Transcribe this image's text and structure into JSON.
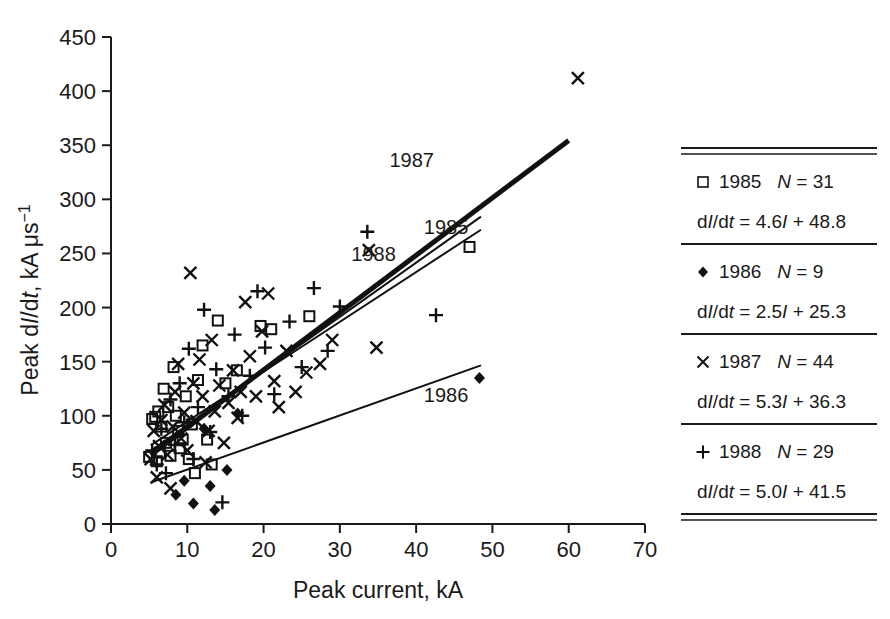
{
  "chart_data": {
    "type": "scatter",
    "title": "",
    "xlabel": "Peak current, kA",
    "ylabel_parts": {
      "pre": "Peak d",
      "i1": "I",
      "mid": "/d",
      "i2": "t",
      "post": ", kA μs",
      "sup": "−1"
    },
    "ylabel": "Peak dI/dt, kA μs−1",
    "xlim": [
      0,
      70
    ],
    "ylim": [
      0,
      450
    ],
    "xticks": [
      "0",
      "10",
      "20",
      "30",
      "40",
      "50",
      "60",
      "70"
    ],
    "yticks": [
      "0",
      "50",
      "100",
      "150",
      "200",
      "250",
      "300",
      "350",
      "400",
      "450"
    ],
    "xtick_values": [
      0,
      10,
      20,
      30,
      40,
      50,
      60,
      70
    ],
    "ytick_values": [
      0,
      50,
      100,
      150,
      200,
      250,
      300,
      350,
      400,
      450
    ],
    "grid": false,
    "legend_position": "right-table",
    "inline_labels": [
      {
        "text": "1987",
        "x": 36.5,
        "y": 330
      },
      {
        "text": "1985",
        "x": 41.0,
        "y": 268
      },
      {
        "text": "1988",
        "x": 31.5,
        "y": 243
      },
      {
        "text": "1986",
        "x": 41.0,
        "y": 113
      }
    ],
    "series": [
      {
        "name": "1985",
        "marker": "open-square",
        "n": 31,
        "fit": {
          "slope": 4.6,
          "intercept": 48.8,
          "x_start": 5.2,
          "x_end": 48.5,
          "label": "1985",
          "weight": "normal"
        },
        "points": [
          [
            5.0,
            62
          ],
          [
            5.4,
            97
          ],
          [
            5.8,
            99
          ],
          [
            6.0,
            58
          ],
          [
            6.2,
            104
          ],
          [
            6.4,
            66
          ],
          [
            6.6,
            90
          ],
          [
            6.9,
            125
          ],
          [
            7.2,
            75
          ],
          [
            7.5,
            108
          ],
          [
            7.8,
            63
          ],
          [
            8.2,
            145
          ],
          [
            8.5,
            100
          ],
          [
            8.8,
            86
          ],
          [
            9.0,
            70
          ],
          [
            9.4,
            78
          ],
          [
            9.8,
            118
          ],
          [
            10.2,
            60
          ],
          [
            10.6,
            92
          ],
          [
            11.0,
            47
          ],
          [
            11.4,
            133
          ],
          [
            12.0,
            165
          ],
          [
            12.6,
            78
          ],
          [
            13.2,
            55
          ],
          [
            14.0,
            188
          ],
          [
            15.0,
            130
          ],
          [
            16.5,
            142
          ],
          [
            19.6,
            183
          ],
          [
            21.0,
            180
          ],
          [
            26.0,
            192
          ],
          [
            47.0,
            256
          ]
        ]
      },
      {
        "name": "1986",
        "marker": "filled-diamond",
        "n": 9,
        "fit": {
          "slope": 2.5,
          "intercept": 25.3,
          "x_start": 5.2,
          "x_end": 48.5,
          "label": "1986",
          "weight": "normal"
        },
        "points": [
          [
            8.5,
            27
          ],
          [
            9.6,
            40
          ],
          [
            10.8,
            19
          ],
          [
            12.2,
            88
          ],
          [
            13.0,
            35
          ],
          [
            13.6,
            13
          ],
          [
            15.2,
            50
          ],
          [
            16.6,
            102
          ],
          [
            48.3,
            135
          ]
        ]
      },
      {
        "name": "1987",
        "marker": "cross",
        "n": 44,
        "fit": {
          "slope": 5.3,
          "intercept": 36.3,
          "x_start": 5.2,
          "x_end": 60.0,
          "label": "1987",
          "weight": "thick"
        },
        "points": [
          [
            5.2,
            60
          ],
          [
            5.6,
            86
          ],
          [
            6.0,
            43
          ],
          [
            6.3,
            72
          ],
          [
            6.6,
            96
          ],
          [
            7.0,
            110
          ],
          [
            7.4,
            64
          ],
          [
            7.8,
            33
          ],
          [
            8.1,
            90
          ],
          [
            8.4,
            122
          ],
          [
            8.8,
            148
          ],
          [
            9.2,
            79
          ],
          [
            9.6,
            103
          ],
          [
            10.0,
            68
          ],
          [
            10.4,
            232
          ],
          [
            10.8,
            130
          ],
          [
            11.2,
            95
          ],
          [
            11.6,
            152
          ],
          [
            12.0,
            118
          ],
          [
            12.4,
            57
          ],
          [
            12.8,
            86
          ],
          [
            13.2,
            170
          ],
          [
            13.6,
            104
          ],
          [
            14.2,
            128
          ],
          [
            14.8,
            75
          ],
          [
            15.4,
            112
          ],
          [
            16.0,
            142
          ],
          [
            16.6,
            98
          ],
          [
            17.0,
            122
          ],
          [
            17.6,
            205
          ],
          [
            18.2,
            155
          ],
          [
            19.0,
            118
          ],
          [
            19.8,
            178
          ],
          [
            20.6,
            213
          ],
          [
            21.4,
            132
          ],
          [
            22.0,
            108
          ],
          [
            23.0,
            160
          ],
          [
            24.2,
            122
          ],
          [
            25.6,
            140
          ],
          [
            27.4,
            148
          ],
          [
            29.0,
            170
          ],
          [
            33.8,
            253
          ],
          [
            34.8,
            163
          ],
          [
            61.2,
            412
          ]
        ]
      },
      {
        "name": "1988",
        "marker": "plus",
        "n": 29,
        "fit": {
          "slope": 5.0,
          "intercept": 41.5,
          "x_start": 5.2,
          "x_end": 48.5,
          "label": "1988",
          "weight": "normal"
        },
        "points": [
          [
            5.4,
            68
          ],
          [
            6.0,
            55
          ],
          [
            6.6,
            88
          ],
          [
            7.2,
            47
          ],
          [
            7.8,
            115
          ],
          [
            8.4,
            73
          ],
          [
            9.0,
            130
          ],
          [
            9.6,
            94
          ],
          [
            10.2,
            162
          ],
          [
            10.8,
            60
          ],
          [
            11.4,
            108
          ],
          [
            12.2,
            198
          ],
          [
            13.0,
            85
          ],
          [
            13.8,
            143
          ],
          [
            14.6,
            20
          ],
          [
            15.4,
            118
          ],
          [
            16.2,
            175
          ],
          [
            17.2,
            100
          ],
          [
            18.2,
            137
          ],
          [
            19.2,
            215
          ],
          [
            20.2,
            163
          ],
          [
            21.4,
            120
          ],
          [
            23.4,
            187
          ],
          [
            25.0,
            145
          ],
          [
            26.6,
            218
          ],
          [
            28.4,
            160
          ],
          [
            30.0,
            201
          ],
          [
            33.6,
            270
          ],
          [
            42.6,
            193
          ]
        ]
      }
    ]
  },
  "legend": {
    "rows": [
      {
        "marker": "open-square",
        "year": "1985",
        "n_prefix": "N",
        "n_eq": " = ",
        "n_value": "31",
        "eq_lhs_d1": "d",
        "eq_lhs_i": "I",
        "eq_lhs_d2": "/d",
        "eq_lhs_t": "t",
        "eq_rhs": " = 4.6",
        "eq_var": "I",
        "eq_tail": " + 48.8",
        "equation": "dI/dt = 4.6I + 48.8"
      },
      {
        "marker": "filled-diamond",
        "year": "1986",
        "n_prefix": "N",
        "n_eq": " = ",
        "n_value": "9",
        "eq_lhs_d1": "d",
        "eq_lhs_i": "I",
        "eq_lhs_d2": "/d",
        "eq_lhs_t": "t",
        "eq_rhs": " = 2.5",
        "eq_var": "I",
        "eq_tail": " + 25.3",
        "equation": "dI/dt = 2.5I + 25.3"
      },
      {
        "marker": "cross",
        "year": "1987",
        "n_prefix": "N",
        "n_eq": " = ",
        "n_value": "44",
        "eq_lhs_d1": "d",
        "eq_lhs_i": "I",
        "eq_lhs_d2": "/d",
        "eq_lhs_t": "t",
        "eq_rhs": " = 5.3",
        "eq_var": "I",
        "eq_tail": " + 36.3",
        "equation": "dI/dt = 5.3I + 36.3"
      },
      {
        "marker": "plus",
        "year": "1988",
        "n_prefix": "N",
        "n_eq": " = ",
        "n_value": "29",
        "eq_lhs_d1": "d",
        "eq_lhs_i": "I",
        "eq_lhs_d2": "/d",
        "eq_lhs_t": "t",
        "eq_rhs": " = 5.0",
        "eq_var": "I",
        "eq_tail": " + 41.5",
        "equation": "dI/dt = 5.0I + 41.5"
      }
    ]
  },
  "colors": {
    "ink": "#1a1a1a",
    "marker": "#111111",
    "background": "#ffffff"
  }
}
